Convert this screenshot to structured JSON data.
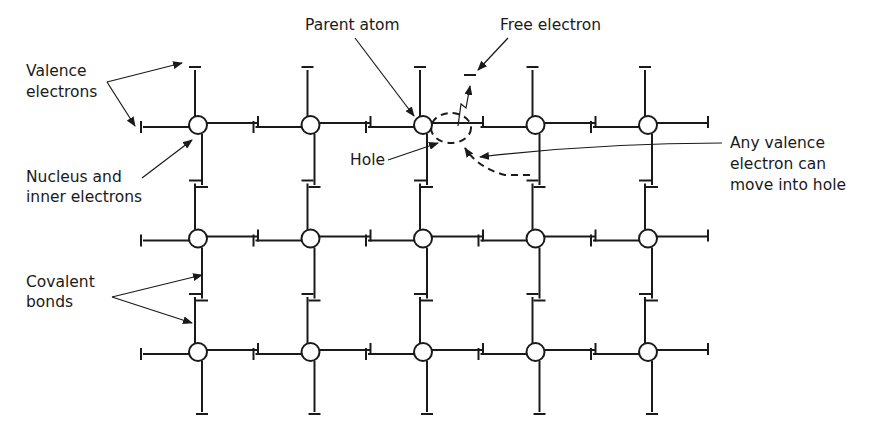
{
  "figure": {
    "type": "crystal-lattice-diagram",
    "lattice": {
      "columns": 5,
      "rows": 3
    },
    "labels": {
      "valence_electrons": [
        "Valence",
        "electrons"
      ],
      "nucleus": [
        "Nucleus and",
        "inner electrons"
      ],
      "covalent_bonds": [
        "Covalent",
        "bonds"
      ],
      "parent_atom": "Parent atom",
      "free_electron": "Free electron",
      "hole": "Hole",
      "any_valence": [
        "Any valence",
        "electron can",
        "move into hole"
      ]
    },
    "colors": {
      "ink": "#1a1a1a",
      "background": "#ffffff"
    }
  }
}
